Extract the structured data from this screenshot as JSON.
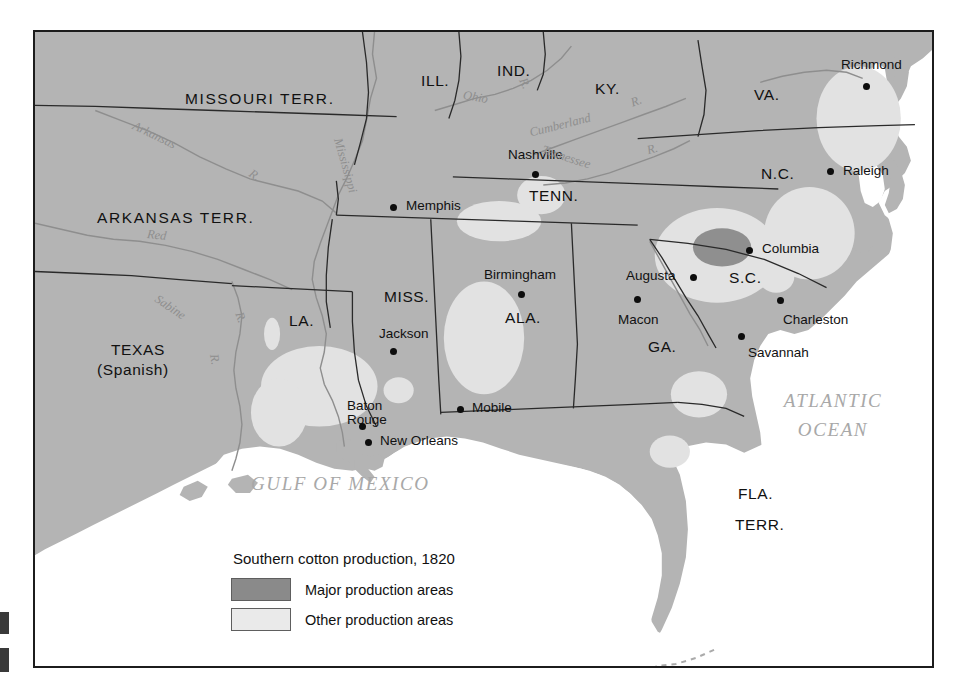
{
  "figure": {
    "kind": "historical-thematic-map",
    "frame_border_color": "#1c1c1c"
  },
  "palette": {
    "land": "#b4b4b4",
    "water": "#ffffff",
    "major_production": "#8f8f8f",
    "other_production": "#e2e2e2",
    "legend_major_swatch": "#8a8a8a",
    "legend_other_swatch": "#eaeaea",
    "border_line": "#2a2a2a",
    "river_line": "#8e8e8e",
    "label_text": "#111111",
    "ocean_text": "#a8a8a8"
  },
  "legend": {
    "title": "Southern cotton production, 1820",
    "entries": [
      {
        "label": "Major production areas",
        "swatch": "#8a8a8a"
      },
      {
        "label": "Other production areas",
        "swatch": "#eaeaea"
      }
    ]
  },
  "states": [
    {
      "name": "MISSOURI  TERR.",
      "x": 150,
      "y": 66
    },
    {
      "name": "ARKANSAS  TERR.",
      "x": 62,
      "y": 185
    },
    {
      "name": "ILL.",
      "x": 386,
      "y": 48
    },
    {
      "name": "IND.",
      "x": 462,
      "y": 38
    },
    {
      "name": "KY.",
      "x": 560,
      "y": 56
    },
    {
      "name": "VA.",
      "x": 719,
      "y": 62
    },
    {
      "name": "N.C.",
      "x": 726,
      "y": 141
    },
    {
      "name": "S.C.",
      "x": 694,
      "y": 245
    },
    {
      "name": "TENN.",
      "x": 494,
      "y": 163
    },
    {
      "name": "MISS.",
      "x": 349,
      "y": 264
    },
    {
      "name": "ALA.",
      "x": 470,
      "y": 285
    },
    {
      "name": "GA.",
      "x": 613,
      "y": 314
    },
    {
      "name": "LA.",
      "x": 254,
      "y": 288
    },
    {
      "name": "TEXAS",
      "x": 76,
      "y": 317
    },
    {
      "name": "(Spanish)",
      "x": 62,
      "y": 337
    },
    {
      "name": "FLA.",
      "x": 703,
      "y": 461
    },
    {
      "name": "TERR.",
      "x": 700,
      "y": 492
    }
  ],
  "cities": [
    {
      "name": "Richmond",
      "label_x": 806,
      "label_y": 33,
      "dot_x": 828,
      "dot_y": 55
    },
    {
      "name": "Raleigh",
      "label_x": 808,
      "label_y": 139,
      "dot_x": 795,
      "dot_y": 146
    },
    {
      "name": "Nashville",
      "label_x": 473,
      "label_y": 123,
      "dot_x": 500,
      "dot_y": 143
    },
    {
      "name": "Memphis",
      "label_x": 371,
      "label_y": 174,
      "dot_x": 358,
      "dot_y": 181
    },
    {
      "name": "Columbia",
      "label_x": 727,
      "label_y": 217,
      "dot_x": 714,
      "dot_y": 224
    },
    {
      "name": "Augusta",
      "label_x": 597,
      "label_y": 244,
      "dot_x": 657,
      "dot_y": 251
    },
    {
      "name": "Macon",
      "label_x": 586,
      "label_y": 288,
      "dot_x": 602,
      "dot_y": 272
    },
    {
      "name": "Charleston",
      "label_x": 748,
      "label_y": 288,
      "dot_x": 745,
      "dot_y": 274
    },
    {
      "name": "Savannah",
      "label_x": 713,
      "label_y": 321,
      "dot_x": 706,
      "dot_y": 310
    },
    {
      "name": "Birmingham",
      "label_x": 452,
      "label_y": 243,
      "dot_x": 486,
      "dot_y": 263
    },
    {
      "name": "Jackson",
      "label_x": 344,
      "label_y": 302,
      "dot_x": 358,
      "dot_y": 320
    },
    {
      "name": "Mobile",
      "label_x": 437,
      "label_y": 376,
      "dot_x": 425,
      "dot_y": 383
    },
    {
      "name": "Baton Rouge",
      "label_x": 312,
      "label_y": 375,
      "dot_x": 327,
      "dot_y": 395,
      "two_line": true
    },
    {
      "name": "New Orleans",
      "label_x": 345,
      "label_y": 409,
      "dot_x": 333,
      "dot_y": 416
    }
  ],
  "rivers": [
    {
      "name": "Arkansas",
      "x": 136,
      "y": 118,
      "rotate": -22
    },
    {
      "name": "R.",
      "x": 243,
      "y": 146,
      "rotate": -10
    },
    {
      "name": "Mississippi",
      "x": 316,
      "y": 132,
      "rotate": 74
    },
    {
      "name": "Red",
      "x": 146,
      "y": 212,
      "rotate": -6
    },
    {
      "name": "Sabine",
      "x": 150,
      "y": 290,
      "rotate": 28
    },
    {
      "name": "R.",
      "x": 196,
      "y": 330,
      "rotate": 78
    },
    {
      "name": "R.",
      "x": 233,
      "y": 290,
      "rotate": 70
    },
    {
      "name": "Ohio",
      "x": 461,
      "y": 68,
      "rotate": 12
    },
    {
      "name": "R.",
      "x": 513,
      "y": 58,
      "rotate": 60
    },
    {
      "name": "Cumberland",
      "x": 524,
      "y": 95,
      "rotate": -16
    },
    {
      "name": "R.",
      "x": 615,
      "y": 78,
      "rotate": -20
    },
    {
      "name": "Tennessee",
      "x": 540,
      "y": 137,
      "rotate": 20
    },
    {
      "name": "R.",
      "x": 628,
      "y": 126,
      "rotate": -14
    }
  ],
  "oceans": [
    {
      "name": "GULF  OF  MEXICO",
      "x": 248,
      "y": 462,
      "lines": [
        "GULF    OF    MEXICO"
      ]
    },
    {
      "name": "ATLANTIC OCEAN",
      "x": 774,
      "y": 383,
      "lines": [
        "ATLANTIC",
        "OCEAN"
      ]
    }
  ]
}
